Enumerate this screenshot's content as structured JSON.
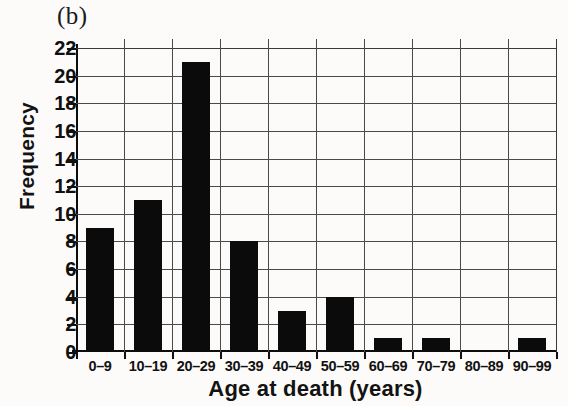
{
  "figure": {
    "panel_label": "(b)",
    "x_axis_title": "Age at death (years)",
    "y_axis_title": "Frequency",
    "bar_color": "#0b0b0b",
    "grid_color": "#4a4a4a",
    "axis_color": "#0d0d0d"
  },
  "chart_data": {
    "type": "bar",
    "title": "(b)",
    "xlabel": "Age at death (years)",
    "ylabel": "Frequency",
    "categories": [
      "0–9",
      "10–19",
      "20–29",
      "30–39",
      "40–49",
      "50–59",
      "60–69",
      "70–79",
      "80–89",
      "90–99"
    ],
    "values": [
      9,
      11,
      21,
      8,
      3,
      4,
      1,
      1,
      0,
      1
    ],
    "ylim": [
      0,
      22
    ],
    "ytick_step": 2,
    "ytick_labels": [
      "0",
      "2",
      "4",
      "6",
      "8",
      "10",
      "12",
      "14",
      "16",
      "18",
      "20",
      "22"
    ],
    "grid": true,
    "legend": null,
    "orientation": "vertical"
  }
}
